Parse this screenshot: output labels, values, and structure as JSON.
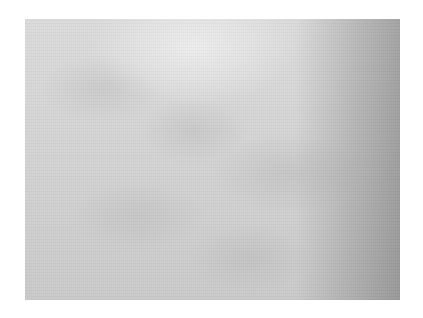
{
  "image": {
    "description": "grayscale textured surface photo",
    "colors": {
      "light": "#e2e2e2",
      "mid": "#d0d0d0",
      "dark": "#a8a8a8",
      "background": "#ffffff"
    }
  }
}
